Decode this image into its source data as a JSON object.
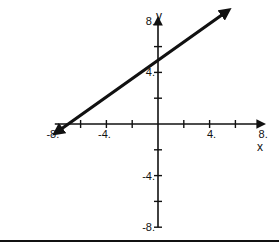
{
  "chart_data": {
    "type": "line",
    "title": "",
    "xlabel": "x",
    "ylabel": "y",
    "xlim": [
      -8,
      8
    ],
    "ylim": [
      -8,
      8
    ],
    "grid": false,
    "x_ticks": [
      -8,
      -6,
      -4,
      -2,
      2,
      4,
      6,
      8
    ],
    "y_ticks": [
      -8,
      -6,
      -4,
      -2,
      2,
      4,
      6,
      8
    ],
    "x_tick_labels": [
      {
        "value": -8,
        "label": "-8."
      },
      {
        "value": -4,
        "label": "-4."
      },
      {
        "value": 4,
        "label": "4."
      },
      {
        "value": 8,
        "label": "8."
      }
    ],
    "y_tick_labels": [
      {
        "value": 8,
        "label": "8."
      },
      {
        "value": 4,
        "label": "4."
      },
      {
        "value": -4,
        "label": "-4."
      },
      {
        "value": -8,
        "label": "-8."
      }
    ],
    "series": [
      {
        "name": "line",
        "slope": 0.7,
        "intercept": 5,
        "x": [
          -7.8,
          5.3
        ],
        "y": [
          -0.6,
          8.7
        ],
        "arrows": "both"
      }
    ]
  }
}
